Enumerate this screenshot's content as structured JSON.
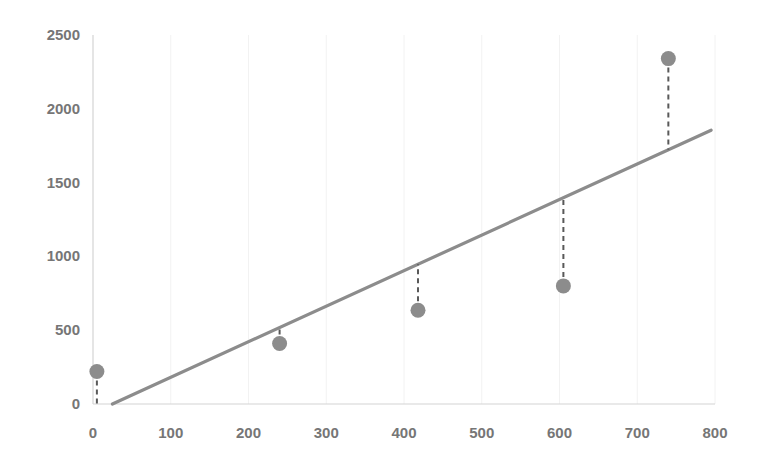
{
  "chart_data": {
    "type": "scatter",
    "title": "",
    "subtitle": "",
    "xlabel": "",
    "ylabel": "",
    "xlim": [
      0,
      800
    ],
    "ylim": [
      0,
      2500
    ],
    "xticks": [
      0,
      100,
      200,
      300,
      400,
      500,
      600,
      700,
      800
    ],
    "yticks": [
      0,
      500,
      1000,
      1500,
      2000,
      2500
    ],
    "xtick_labels": [
      "0",
      "100",
      "200",
      "300",
      "400",
      "500",
      "600",
      "700",
      "800"
    ],
    "ytick_labels": [
      "0",
      "500",
      "1000",
      "1500",
      "2000",
      "2500"
    ],
    "grid": "faint vertical gridlines only",
    "legend": "none",
    "annotations": [],
    "series": [
      {
        "name": "observations",
        "type": "scatter",
        "marker": "filled-circle",
        "color": "#8c8c8c",
        "x": [
          5,
          240,
          418,
          605,
          740
        ],
        "y": [
          220,
          410,
          635,
          800,
          2340
        ]
      },
      {
        "name": "fitted-regression-line",
        "type": "line",
        "color": "#8c8c8c",
        "slope": 2.41,
        "intercept": -60,
        "x": [
          25,
          795
        ],
        "y": [
          0,
          1855
        ]
      },
      {
        "name": "residual-segments",
        "type": "line",
        "style": "dashed",
        "color": "#595959",
        "segments": [
          {
            "x": 5,
            "y_point": 220,
            "y_fit": 0
          },
          {
            "x": 240,
            "y_point": 410,
            "y_fit": 518
          },
          {
            "x": 418,
            "y_point": 635,
            "y_fit": 947
          },
          {
            "x": 605,
            "y_point": 800,
            "y_fit": 1398
          },
          {
            "x": 740,
            "y_point": 2340,
            "y_fit": 1723
          }
        ]
      }
    ]
  },
  "plot": {
    "background_color": "#ffffff",
    "axis_color": "#d4d4d4",
    "gridline_color": "#f2f2f2",
    "tick_label_color": "#767676",
    "point_color": "#8c8c8c",
    "line_color": "#8c8c8c",
    "residual_color": "#595959"
  }
}
